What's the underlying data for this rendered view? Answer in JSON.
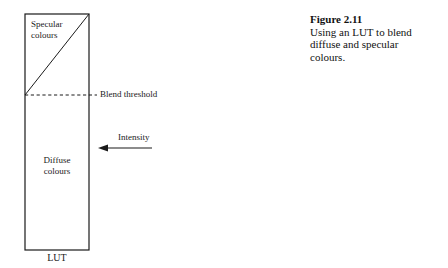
{
  "figure": {
    "caption_title": "Figure 2.11",
    "caption_body": "Using an LUT to blend diffuse and specular colours.",
    "background_color": "#ffffff",
    "line_color": "#1a1a1a"
  },
  "diagram": {
    "lut_label": "LUT",
    "specular_label_line1": "Specular",
    "specular_label_line2": "colours",
    "diffuse_label_line1": "Diffuse",
    "diffuse_label_line2": "colours",
    "blend_threshold_label": "Blend threshold",
    "intensity_label": "Intensity",
    "rect": {
      "x": 25,
      "y": 14,
      "width": 64,
      "height": 236
    },
    "diagonal": {
      "x1": 25,
      "y1": 95,
      "x2": 89,
      "y2": 14
    },
    "threshold_line": {
      "x1": 25,
      "y1": 95,
      "x2": 97,
      "y2": 95,
      "style": "dashed"
    },
    "intensity_arrow": {
      "x1": 152,
      "y1": 148,
      "x2": 99,
      "y2": 148,
      "direction": "left"
    }
  }
}
